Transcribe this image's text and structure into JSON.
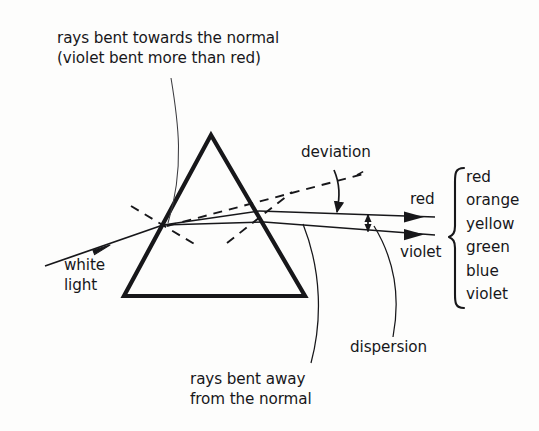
{
  "figure": {
    "kind": "optics-ray-diagram",
    "background_color": "#fdfdfc",
    "ink_color": "#17171a",
    "annotations": {
      "top_note_line1": "rays bent towards the normal",
      "top_note_line2": "(violet bent more than red)",
      "deviation": "deviation",
      "dispersion": "dispersion",
      "bottom_note_line1": "rays bent away",
      "bottom_note_line2": "from the normal",
      "source_line1": "white",
      "source_line2": "light"
    },
    "ray_labels": {
      "red": "red",
      "violet": "violet"
    },
    "spectrum": {
      "brace": "curly-brace",
      "colors": [
        "red",
        "orange",
        "yellow",
        "green",
        "blue",
        "violet"
      ]
    }
  }
}
